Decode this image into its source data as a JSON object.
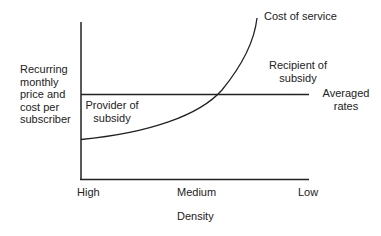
{
  "diagram": {
    "y_axis_label": [
      "Recurring",
      "monthly",
      "price and",
      "cost per",
      "subscriber"
    ],
    "x_axis_label": "Density",
    "x_ticks": [
      "High",
      "Medium",
      "Low"
    ],
    "curve_label": "Cost of service",
    "line_label": [
      "Averaged",
      "rates"
    ],
    "region_below_cross": [
      "Provider of",
      "subsidy"
    ],
    "region_above_cross": [
      "Recipient of",
      "subsidy"
    ],
    "colors": {
      "line": "#222222",
      "text": "#222222",
      "background": "#ffffff"
    }
  }
}
